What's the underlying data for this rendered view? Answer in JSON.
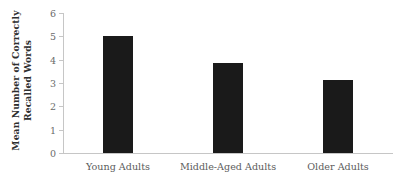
{
  "chart_data": {
    "type": "bar",
    "title": "",
    "xlabel": "",
    "ylabel_line1": "Mean Number of Correctly",
    "ylabel_line2": "Recalled Words",
    "ylabel": "Mean Number of Correctly Recalled Words",
    "categories": [
      "Young Adults",
      "Middle-Aged Adults",
      "Older Adults"
    ],
    "values": [
      5.0,
      3.85,
      3.15
    ],
    "ylim": [
      0,
      6
    ],
    "yticks": [
      0,
      1,
      2,
      3,
      4,
      5,
      6
    ],
    "ytick_labels": [
      "0",
      "1",
      "2",
      "3",
      "4",
      "5",
      "6"
    ],
    "grid": false,
    "legend": false,
    "bar_color": "#1a1a1a",
    "axis_color": "#c6c6c6",
    "text_color": "#5c5c5c"
  }
}
